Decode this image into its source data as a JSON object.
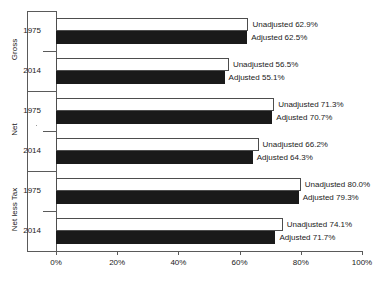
{
  "chart_data": {
    "type": "bar",
    "orientation": "horizontal",
    "title": "",
    "xlabel": "",
    "ylabel": "",
    "xlim": [
      0,
      100
    ],
    "xticks": [
      0,
      20,
      40,
      60,
      80,
      100
    ],
    "xtick_labels": [
      "0%",
      "20%",
      "40%",
      "60%",
      "80%",
      "100%"
    ],
    "grid": false,
    "legend": "none",
    "series": [
      {
        "name": "Unadjusted",
        "style": "white-outlined"
      },
      {
        "name": "Adjusted",
        "style": "solid-black"
      }
    ],
    "groups": [
      {
        "label": "Gross",
        "years": [
          {
            "year": "1975",
            "bars": [
              {
                "series": "Unadjusted",
                "value": 62.9,
                "label": "Unadjusted 62.9%"
              },
              {
                "series": "Adjusted",
                "value": 62.5,
                "label": "Adjusted 62.5%"
              }
            ]
          },
          {
            "year": "2014",
            "bars": [
              {
                "series": "Unadjusted",
                "value": 56.5,
                "label": "Unadjusted 56.5%"
              },
              {
                "series": "Adjusted",
                "value": 55.1,
                "label": "Adjusted 55.1%"
              }
            ]
          }
        ]
      },
      {
        "label": "Net",
        "years": [
          {
            "year": "1975",
            "bars": [
              {
                "series": "Unadjusted",
                "value": 71.3,
                "label": "Unadjusted 71.3%"
              },
              {
                "series": "Adjusted",
                "value": 70.7,
                "label": "Adjusted 70.7%"
              }
            ]
          },
          {
            "year": "2014",
            "bars": [
              {
                "series": "Unadjusted",
                "value": 66.2,
                "label": "Unadjusted 66.2%"
              },
              {
                "series": "Adjusted",
                "value": 64.3,
                "label": "Adjusted 64.3%"
              }
            ]
          }
        ]
      },
      {
        "label": "Net less Tax",
        "years": [
          {
            "year": "1975",
            "bars": [
              {
                "series": "Unadjusted",
                "value": 80.0,
                "label": "Unadjusted 80.0%"
              },
              {
                "series": "Adjusted",
                "value": 79.3,
                "label": "Adjusted 79.3%"
              }
            ]
          },
          {
            "year": "2014",
            "bars": [
              {
                "series": "Unadjusted",
                "value": 74.1,
                "label": "Unadjusted 74.1%"
              },
              {
                "series": "Adjusted",
                "value": 71.7,
                "label": "Adjusted 71.7%"
              }
            ]
          }
        ]
      }
    ],
    "colors": {
      "unadjusted_fill": "#ffffff",
      "unadjusted_stroke": "#4d4d4d",
      "adjusted_fill": "#1a1a1a",
      "axis": "#5a5a5a",
      "text": "#1a1a1a",
      "background": "#ffffff"
    }
  }
}
